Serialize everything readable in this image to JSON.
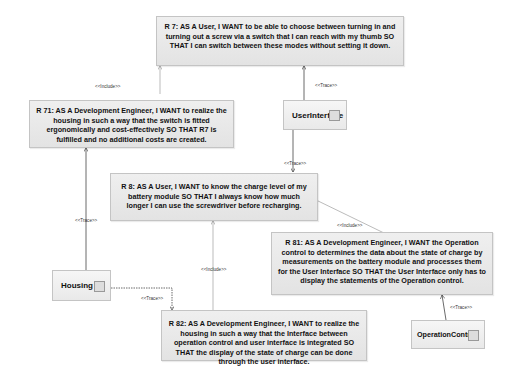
{
  "requirements": [
    {
      "id": "R7",
      "text": "R 7: AS A User, I WANT to be able to choose between turning in and turning out a screw via a switch that I can reach with my thumb SO THAT I can switch between these modes without setting it down."
    },
    {
      "id": "R71",
      "text": "R 71:  AS A Development Engineer, I WANT to realize the housing in such a way that the switch is fitted ergonomically and cost-effectively SO THAT R7 is fulfilled and no additional costs are created."
    },
    {
      "id": "R8",
      "text": "R 8: AS A User, I WANT to know the charge level of my battery module SO THAT I always know how much longer I can use the screwdriver before recharging."
    },
    {
      "id": "R81",
      "text": "R 81: AS A Development Engineer, I WANT the Operation control to determines the data about the state of charge by measurements on the battery module and processes them for the User Interface SO THAT  the User Interface only has to display the statements of the Operation control."
    },
    {
      "id": "R82",
      "text": "R 82: AS A  Development Engineer, I WANT to realize the housing in such a way that the Interface between operation control and user interface is integrated SO THAT the display of the state of charge can be done through the user interface."
    }
  ],
  "blocks": [
    {
      "id": "UserInterface",
      "label": "UserInterface"
    },
    {
      "id": "Housing",
      "label": "Housing"
    },
    {
      "id": "OperationControl",
      "label": "OperationControl"
    }
  ],
  "relations": [
    {
      "from": "R71",
      "to": "R7",
      "label": "<<Include>>"
    },
    {
      "from": "UserInterface",
      "to": "R7",
      "label": "<<Trace>>"
    },
    {
      "from": "UserInterface",
      "to": "R8",
      "label": "<<Trace>>"
    },
    {
      "from": "Housing",
      "to": "R71",
      "label": "<<Trace>>"
    },
    {
      "from": "R81",
      "to": "R8",
      "label": "<<Include>>"
    },
    {
      "from": "R82",
      "to": "R8",
      "label": "<<Include>>"
    },
    {
      "from": "Housing",
      "to": "R82",
      "label": "<<Trace>>"
    },
    {
      "from": "OperationControl",
      "to": "R81",
      "label": "<<Trace>>"
    }
  ],
  "colors": {
    "box_fill": "#e8e8e8",
    "box_border": "#c4c4c4",
    "line": "#555555",
    "include_line": "#999999"
  }
}
